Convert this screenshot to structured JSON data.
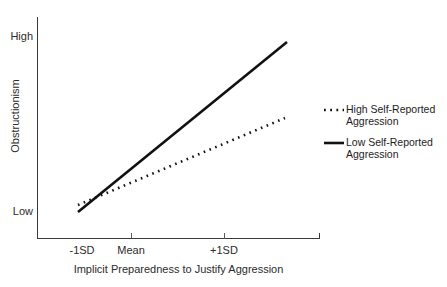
{
  "chart_data": {
    "type": "line",
    "title": "",
    "subtitle": "",
    "xlabel": "Implicit Preparedness to Justify Aggression",
    "ylabel": "Obstructionism",
    "categories": [
      "-1SD",
      "Mean",
      "+1SD"
    ],
    "x_tick_labels": [
      "-1SD",
      "Mean",
      "+1SD"
    ],
    "y_tick_labels": [
      "High",
      "Low"
    ],
    "ylim_labels": {
      "min": "Low",
      "max": "High"
    },
    "grid": false,
    "legend_position": "right",
    "series": [
      {
        "name": "High Self-Reported Aggression",
        "label_line1": "High Self-Reported",
        "label_line2": "Aggression",
        "style": "dotted",
        "color": "#111111",
        "values": [
          0.13,
          0.42,
          0.7
        ],
        "pixel_points": [
          [
            78,
            205
          ],
          [
            181,
            161
          ],
          [
            285,
            118
          ]
        ]
      },
      {
        "name": "Low Self-Reported Aggression",
        "label_line1": "Low Self-Reported",
        "label_line2": "Aggression",
        "style": "solid",
        "color": "#111111",
        "values": [
          0.1,
          0.5,
          0.91
        ],
        "pixel_points": [
          [
            78,
            212
          ],
          [
            182,
            127
          ],
          [
            287,
            42
          ]
        ]
      }
    ],
    "axis_ranges": {
      "x_pixels": [
        37,
        320
      ],
      "y_pixels": [
        17,
        238
      ]
    }
  },
  "axes": {
    "y_high_label": "High",
    "y_low_label": "Low",
    "y_axis_title": "Obstructionism",
    "x_axis_title": "Implicit Preparedness to Justify Aggression",
    "x_tick_minus": "-1SD",
    "x_tick_mean": "Mean",
    "x_tick_plus": "+1SD"
  },
  "legend": {
    "items": [
      {
        "line1": "High Self-Reported",
        "line2": "Aggression",
        "style": "dotted"
      },
      {
        "line1": "Low Self-Reported",
        "line2": "Aggression",
        "style": "solid"
      }
    ]
  },
  "colors": {
    "axis": "#3a3a3a",
    "series": "#111111",
    "text": "#2b2b2b",
    "background": "#ffffff"
  }
}
